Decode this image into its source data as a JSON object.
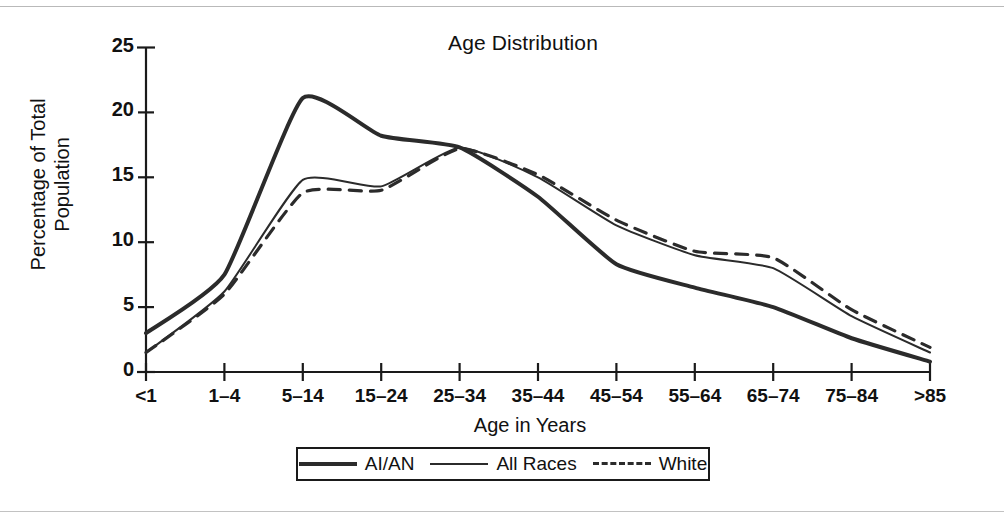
{
  "chart_data": {
    "type": "line",
    "title": "Age Distribution",
    "xlabel": "Age in Years",
    "ylabel": "Percentage of Total Population",
    "ylabel_line1": "Percentage of Total",
    "ylabel_line2": "Population",
    "categories": [
      "<1",
      "1–4",
      "5–14",
      "15–24",
      "25–34",
      "35–44",
      "45–54",
      "55–64",
      "65–74",
      "75–84",
      ">85"
    ],
    "yticks": [
      "0",
      "5",
      "10",
      "15",
      "20",
      "25"
    ],
    "ylim": [
      0,
      25
    ],
    "grid": false,
    "legend_position": "bottom-center",
    "series": [
      {
        "name": "AI/AN",
        "style": "solid-thick",
        "values": [
          3.0,
          7.5,
          21.1,
          18.2,
          17.3,
          13.5,
          8.3,
          6.5,
          5.0,
          2.6,
          0.8
        ]
      },
      {
        "name": "All Races",
        "style": "solid-thin",
        "values": [
          1.5,
          6.2,
          14.8,
          14.3,
          17.3,
          15.0,
          11.3,
          9.0,
          8.0,
          4.3,
          1.5
        ]
      },
      {
        "name": "White",
        "style": "dashed",
        "values": [
          1.5,
          6.0,
          13.8,
          14.0,
          17.2,
          15.2,
          11.7,
          9.3,
          8.8,
          4.8,
          1.9
        ]
      }
    ]
  },
  "colors": {
    "line": "#2b2b2b",
    "axis": "#1a1a1a",
    "background": "#ffffff",
    "page_rule": "#b9b9b9"
  },
  "legend": {
    "items": [
      {
        "label": "AI/AN",
        "style": "thick"
      },
      {
        "label": "All Races",
        "style": "thin"
      },
      {
        "label": "White",
        "style": "dashed"
      }
    ]
  }
}
